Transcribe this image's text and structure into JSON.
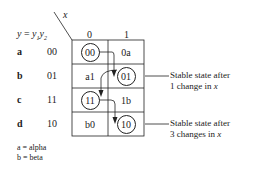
{
  "header": {
    "input_var": "x",
    "state_label_lhs": "y",
    "state_label_eq": "=",
    "state_label_rhs": "y1y2",
    "columns": [
      "0",
      "1"
    ]
  },
  "rows": [
    {
      "name": "a",
      "code": "00",
      "cells": [
        {
          "text": "00",
          "stable": true
        },
        {
          "text": "0a",
          "stable": false
        }
      ]
    },
    {
      "name": "b",
      "code": "01",
      "cells": [
        {
          "text": "a1",
          "stable": false
        },
        {
          "text": "01",
          "stable": true
        }
      ]
    },
    {
      "name": "c",
      "code": "11",
      "cells": [
        {
          "text": "11",
          "stable": true
        },
        {
          "text": "1b",
          "stable": false
        }
      ]
    },
    {
      "name": "d",
      "code": "10",
      "cells": [
        {
          "text": "b0",
          "stable": false
        },
        {
          "text": "10",
          "stable": true
        }
      ]
    }
  ],
  "annotations": [
    {
      "line1": "Stable state after",
      "line2_prefix": "1 change in ",
      "line2_var": "x"
    },
    {
      "line1": "Stable state after",
      "line2_prefix": "3 changes in ",
      "line2_var": "x"
    }
  ],
  "legend": [
    "a = alpha",
    "b = beta"
  ]
}
